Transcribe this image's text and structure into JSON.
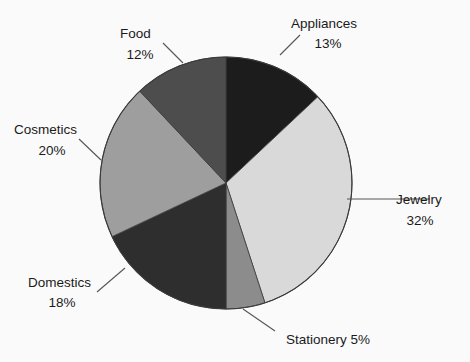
{
  "chart_data": {
    "type": "pie",
    "title": "",
    "subtitle": "",
    "xlabel": "",
    "ylabel": "",
    "legend_position": "none",
    "grid": false,
    "start_angle_deg": 0,
    "direction": "clockwise",
    "units": "percent",
    "total": 100,
    "categories": [
      "Appliances",
      "Jewelry",
      "Stationery",
      "Domestics",
      "Cosmetics",
      "Food"
    ],
    "values": [
      13,
      32,
      5,
      18,
      20,
      12
    ],
    "slices": [
      {
        "name": "Appliances",
        "value": 13,
        "value_text": "13%",
        "color": "#1c1c1c",
        "label_line1": "Appliances",
        "label_line2": "13%",
        "label_single_line": false
      },
      {
        "name": "Jewelry",
        "value": 32,
        "value_text": "32%",
        "color": "#d9d9d9",
        "label_line1": "Jewelry",
        "label_line2": "32%",
        "label_single_line": false
      },
      {
        "name": "Stationery",
        "value": 5,
        "value_text": "5%",
        "color": "#8c8c8c",
        "label_line1": "Stationery 5%",
        "label_line2": "",
        "label_single_line": true
      },
      {
        "name": "Domestics",
        "value": 18,
        "value_text": "18%",
        "color": "#2e2e2e",
        "label_line1": "Domestics",
        "label_line2": "18%",
        "label_single_line": false
      },
      {
        "name": "Cosmetics",
        "value": 20,
        "value_text": "20%",
        "color": "#9e9e9e",
        "label_line1": "Cosmetics",
        "label_line2": "20%",
        "label_single_line": false
      },
      {
        "name": "Food",
        "value": 12,
        "value_text": "12%",
        "color": "#4d4d4d",
        "label_line1": "Food",
        "label_line2": "12%",
        "label_single_line": false
      }
    ],
    "background_color": "#fafafa",
    "outline_color": "#3a3a3a",
    "leader_line_color": "#555555"
  }
}
